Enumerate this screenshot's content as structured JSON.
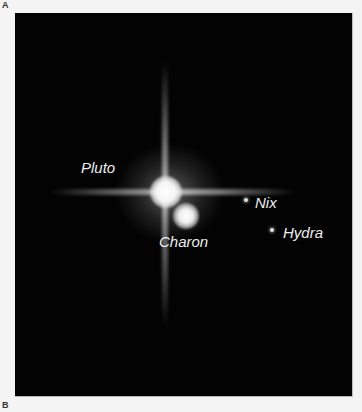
{
  "panels": {
    "top_label": "A",
    "bottom_label": "B"
  },
  "image": {
    "description": "Hubble image of Pluto system",
    "bodies": [
      {
        "name": "Pluto",
        "label": "Pluto"
      },
      {
        "name": "Charon",
        "label": "Charon"
      },
      {
        "name": "Nix",
        "label": "Nix"
      },
      {
        "name": "Hydra",
        "label": "Hydra"
      }
    ]
  }
}
